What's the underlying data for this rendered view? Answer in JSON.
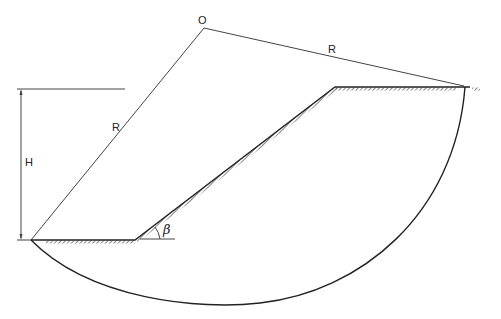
{
  "diagram": {
    "labels": {
      "center": "O",
      "radius_left": "R",
      "radius_right": "R",
      "height": "H",
      "angle": "β"
    },
    "colors": {
      "line": "#333333",
      "background": "#ffffff"
    }
  }
}
